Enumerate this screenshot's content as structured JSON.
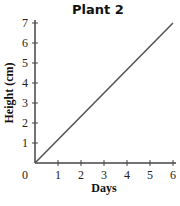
{
  "chart_data": {
    "type": "line",
    "title": "Plant 2",
    "xlabel": "Days",
    "ylabel": "Height (cm)",
    "x_ticks": [
      "0",
      "1",
      "2",
      "3",
      "4",
      "5",
      "6"
    ],
    "y_ticks": [
      "1",
      "2",
      "3",
      "4",
      "5",
      "6",
      "7"
    ],
    "xlim": [
      0,
      6
    ],
    "ylim": [
      0,
      7
    ],
    "grid": false,
    "series": [
      {
        "name": "Plant 2",
        "x": [
          0,
          6
        ],
        "y": [
          0,
          7
        ],
        "color": "#555555"
      }
    ]
  }
}
